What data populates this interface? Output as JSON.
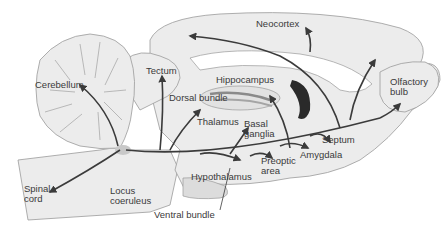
{
  "diagram": {
    "colors": {
      "tissue_fill": "#ececec",
      "outline": "#9a9a9a",
      "pathway": "#3b3b3b",
      "locus_highlight": "#c8c8c8",
      "background": "#ffffff"
    },
    "labels": {
      "neocortex": "Neocortex",
      "cerebellum": "Cerebellum",
      "tectum": "Tectum",
      "hippocampus": "Hippocampus",
      "dorsal_bundle": "Dorsal bundle",
      "olfactory_bulb": "Olfactory\nbulb",
      "thalamus": "Thalamus",
      "basal_ganglia": "Basal\nganglia",
      "septum": "Septum",
      "amygdala": "Amygdala",
      "preoptic_area": "Preoptic\narea",
      "hypothalamus": "Hypothalamus",
      "spinal_cord": "Spinal\ncord",
      "locus_coeruleus": "Locus\ncoeruleus",
      "ventral_bundle": "Ventral bundle"
    }
  }
}
